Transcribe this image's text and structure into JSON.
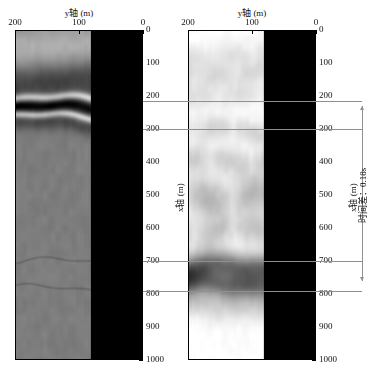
{
  "figure": {
    "panels": [
      {
        "id": "left",
        "top_axis_title": "y轴 (m)",
        "side_axis_title": "x轴 (m)",
        "x_ticks": [
          "200",
          "100",
          "0"
        ],
        "y_ticks": [
          "0",
          "100",
          "200",
          "300",
          "400",
          "500",
          "600",
          "700",
          "800",
          "900",
          "1000"
        ],
        "background_color": "#7e7e7e"
      },
      {
        "id": "right",
        "top_axis_title": "y轴 (m)",
        "side_axis_title": "x轴 (m)",
        "x_ticks": [
          "200",
          "100",
          "0"
        ],
        "y_ticks": [
          "0",
          "100",
          "200",
          "300",
          "400",
          "500",
          "600",
          "700",
          "800",
          "900",
          "1000"
        ],
        "background_color": "#ffffff"
      }
    ],
    "annotation": {
      "label": "时间差：0.18s"
    }
  },
  "chart_data": {
    "type": "heatmap",
    "title": "",
    "xlabel": "y轴 (m)",
    "ylabel": "x轴 (m)",
    "xlim": [
      250,
      0
    ],
    "ylim": [
      0,
      1000
    ],
    "grid": false,
    "legend": "none",
    "panels": [
      {
        "name": "left-section",
        "colormap": "gray",
        "background_level": 0.49,
        "x_ticks": [
          200,
          100,
          0
        ],
        "y_ticks": [
          0,
          100,
          200,
          300,
          400,
          500,
          600,
          700,
          800,
          900,
          1000
        ],
        "events": [
          {
            "depth": 60,
            "amplitude": 0.22,
            "width": 60,
            "type": "bright-diffuse"
          },
          {
            "depth": 150,
            "amplitude": -0.3,
            "width": 45,
            "type": "dark-band"
          },
          {
            "depth": 205,
            "amplitude": 0.5,
            "width": 9,
            "type": "bright-reflector"
          },
          {
            "depth": 232,
            "amplitude": -0.42,
            "width": 16,
            "type": "dark-reflector"
          },
          {
            "depth": 258,
            "amplitude": 0.45,
            "width": 8,
            "type": "bright-reflector"
          },
          {
            "depth": 282,
            "amplitude": -0.2,
            "width": 18,
            "type": "dark-band"
          },
          {
            "depth": 700,
            "amplitude": -0.1,
            "width": 2,
            "type": "thin-line"
          },
          {
            "depth": 782,
            "amplitude": -0.1,
            "width": 2,
            "type": "thin-line"
          }
        ]
      },
      {
        "name": "right-migrated-section",
        "colormap": "gray",
        "background_level": 1.0,
        "x_ticks": [
          200,
          100,
          0
        ],
        "y_ticks": [
          0,
          100,
          200,
          300,
          400,
          500,
          600,
          700,
          800,
          900,
          1000
        ],
        "events": [
          {
            "depth": 70,
            "amplitude": -0.1,
            "width": 30,
            "type": "faint-wavy"
          },
          {
            "depth": 135,
            "amplitude": -0.12,
            "width": 28,
            "type": "faint-wavy"
          },
          {
            "depth": 200,
            "amplitude": -0.1,
            "width": 26,
            "type": "faint-wavy"
          },
          {
            "depth": 300,
            "amplitude": -0.14,
            "width": 28,
            "type": "wavy-lens"
          },
          {
            "depth": 390,
            "amplitude": -0.16,
            "width": 30,
            "type": "wavy-lens"
          },
          {
            "depth": 500,
            "amplitude": -0.22,
            "width": 45,
            "type": "ellipse-blobs"
          },
          {
            "depth": 610,
            "amplitude": -0.18,
            "width": 35,
            "type": "wavy-lens"
          },
          {
            "depth": 720,
            "amplitude": -0.55,
            "width": 30,
            "type": "strong-dark-band"
          },
          {
            "depth": 775,
            "amplitude": -0.5,
            "width": 28,
            "type": "strong-dark-band"
          },
          {
            "depth": 840,
            "amplitude": -0.18,
            "width": 35,
            "type": "fading-band"
          }
        ]
      }
    ],
    "connector_depths": [
      215,
      300,
      700,
      790
    ],
    "annotation": {
      "text": "时间差：0.18s",
      "from_depth": 230,
      "to_depth": 760
    }
  }
}
